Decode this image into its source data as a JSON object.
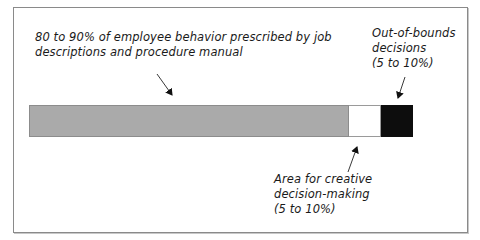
{
  "labels": {
    "prescribed": {
      "line1": "80 to 90% of employee behavior prescribed by job",
      "line2": "descriptions and procedure manual"
    },
    "creative": {
      "line1": "Area for creative",
      "line2": "decision-making",
      "line3": "(5 to 10%)"
    },
    "out_of_bounds": {
      "line1": "Out-of-bounds",
      "line2": "decisions",
      "line3": "(5 to 10%)"
    }
  },
  "segments": [
    {
      "name": "Prescribed behavior",
      "range": "80 to 90%",
      "color": "#aaaaaa"
    },
    {
      "name": "Creative decision-making",
      "range": "5 to 10%",
      "color": "#ffffff"
    },
    {
      "name": "Out-of-bounds decisions",
      "range": "5 to 10%",
      "color": "#0d0d0d"
    }
  ]
}
